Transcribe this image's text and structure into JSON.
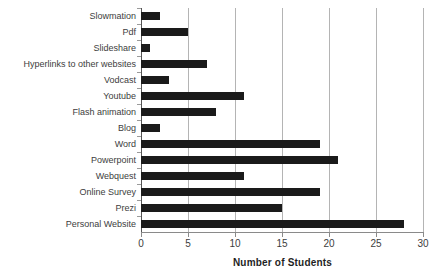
{
  "chart_data": {
    "type": "bar",
    "orientation": "horizontal",
    "title": "",
    "xlabel": "Number of Students",
    "ylabel": "",
    "xlim": [
      0,
      30
    ],
    "xticks": [
      0,
      5,
      10,
      15,
      20,
      25,
      30
    ],
    "grid": "vertical",
    "legend": "none",
    "bar_color": "#1a1a1a",
    "categories": [
      "Slowmation",
      "Pdf",
      "Slideshare",
      "Hyperlinks to other websites",
      "Vodcast",
      "Youtube",
      "Flash animation",
      "Blog",
      "Word",
      "Powerpoint",
      "Webquest",
      "Online Survey",
      "Prezi",
      "Personal Website"
    ],
    "values": [
      2,
      5,
      1,
      7,
      3,
      11,
      8,
      2,
      19,
      21,
      11,
      19,
      15,
      28
    ]
  }
}
